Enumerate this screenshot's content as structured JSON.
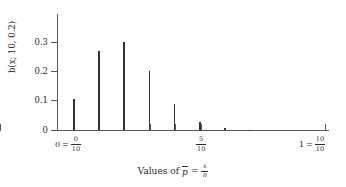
{
  "chart_data": {
    "type": "bar",
    "title": "",
    "subtitle": "",
    "ylabel": "b(x; 10, 0.2)",
    "xlabel": "Values of p̄ = x/n",
    "xlabel_parts": {
      "prefix": "Values of",
      "symbol": "p",
      "equals": "=",
      "numerator": "x",
      "denominator": "n"
    },
    "categories": [
      0,
      1,
      2,
      3,
      4,
      5,
      6,
      7,
      8,
      9,
      10
    ],
    "values": [
      0.107,
      0.268,
      0.302,
      0.201,
      0.088,
      0.026,
      0.0055,
      0.0008,
      0.0001,
      0.0,
      0.0
    ],
    "ylim": [
      0,
      0.35
    ],
    "xlim": [
      0,
      10
    ],
    "ytick_values": [
      0,
      0.1,
      0.2,
      0.3
    ],
    "ytick_labels": [
      "0",
      "0.1",
      "0.2",
      "0.3"
    ],
    "grid": false,
    "legend": null,
    "bar_color": "#333333",
    "axis_color": "#595959",
    "x_annotations": [
      {
        "at": 0,
        "left": "0",
        "equals": "=",
        "numerator": "0",
        "denominator": "10"
      },
      {
        "at": 5,
        "left": "",
        "equals": "",
        "numerator": "5",
        "denominator": "10"
      },
      {
        "at": 10,
        "left": "1",
        "equals": "=",
        "numerator": "10",
        "denominator": "10"
      }
    ],
    "xticks_drawn": [
      0,
      1,
      2,
      3,
      4,
      5,
      10
    ]
  },
  "axis": {
    "y_title": "b(x; 10, 0.2)",
    "ytick_0": "0",
    "ytick_1": "0.1",
    "ytick_2": "0.2",
    "ytick_3": "0.3"
  },
  "labels": {
    "left_value": "0",
    "left_eq": "=",
    "left_num": "0",
    "left_den": "10",
    "mid_num": "5",
    "mid_den": "10",
    "right_value": "1",
    "right_eq": "=",
    "right_num": "10",
    "right_den": "10"
  },
  "caption": {
    "prefix": "Values of",
    "pbar": "p",
    "equals": "=",
    "num": "x",
    "den": "n"
  }
}
